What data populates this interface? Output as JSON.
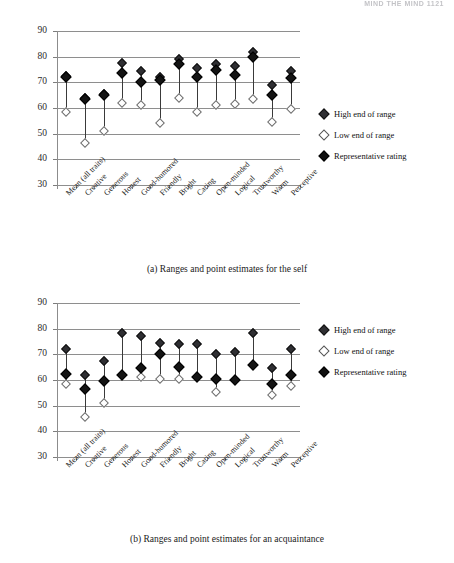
{
  "header": {
    "running_head": "MIND THE MIND 1121"
  },
  "legend": {
    "items": [
      {
        "label": "High end of range",
        "marker": "filled-diamond",
        "color": "#2f2f33"
      },
      {
        "label": "Low end of range",
        "marker": "hollow-diamond",
        "color": "#ffffff"
      },
      {
        "label": "Representative rating",
        "marker": "filled-diamond",
        "color": "#101010"
      }
    ]
  },
  "figures": [
    {
      "id": "a",
      "caption": "(a) Ranges and point estimates for the self"
    },
    {
      "id": "b",
      "caption": "(b) Ranges and point estimates for an acquaintance"
    }
  ],
  "chart_data": [
    {
      "type": "scatter",
      "title": "(a) Ranges and point estimates for the self",
      "xlabel": "",
      "ylabel": "",
      "ylim": [
        30,
        90
      ],
      "yticks": [
        30,
        40,
        50,
        60,
        70,
        80,
        90
      ],
      "grid": true,
      "legend_position": "right",
      "categories": [
        "Mean (all traits)",
        "Creative",
        "Generous",
        "Honest",
        "Good-humored",
        "Friendly",
        "Bright",
        "Caring",
        "Open-minded",
        "Logical",
        "Trustworthy",
        "Warm",
        "Perceptive"
      ],
      "series": [
        {
          "name": "High end of range",
          "values": [
            72.5,
            64.0,
            65.5,
            77.5,
            74.5,
            72.0,
            79.0,
            75.5,
            77.0,
            76.5,
            82.0,
            69.0,
            74.5
          ]
        },
        {
          "name": "Low end of range",
          "values": [
            58.5,
            46.5,
            51.0,
            62.0,
            61.0,
            54.0,
            64.0,
            58.5,
            61.0,
            61.5,
            63.5,
            54.5,
            59.5
          ]
        },
        {
          "name": "Representative rating",
          "values": [
            72.0,
            63.5,
            65.0,
            73.5,
            70.0,
            71.0,
            77.0,
            72.0,
            75.0,
            73.0,
            80.0,
            65.0,
            71.5
          ]
        }
      ]
    },
    {
      "type": "scatter",
      "title": "(b) Ranges and point estimates for an acquaintance",
      "xlabel": "",
      "ylabel": "",
      "ylim": [
        30,
        90
      ],
      "yticks": [
        30,
        40,
        50,
        60,
        70,
        80,
        90
      ],
      "grid": true,
      "legend_position": "right",
      "categories": [
        "Mean (all traits)",
        "Creative",
        "Generous",
        "Honest",
        "Good-humored",
        "Friendly",
        "Bright",
        "Caring",
        "Open-minded",
        "Logical",
        "Trustworthy",
        "Warm",
        "Perceptive"
      ],
      "series": [
        {
          "name": "High end of range",
          "values": [
            72.0,
            62.0,
            67.5,
            78.5,
            77.0,
            74.5,
            74.0,
            74.0,
            70.0,
            71.0,
            78.5,
            64.5,
            72.0
          ]
        },
        {
          "name": "Low end of range",
          "values": [
            58.5,
            45.5,
            51.0,
            62.0,
            61.0,
            60.5,
            60.5,
            61.0,
            55.5,
            60.0,
            66.0,
            54.0,
            57.5
          ]
        },
        {
          "name": "Representative rating",
          "values": [
            62.5,
            56.5,
            59.5,
            62.0,
            64.5,
            70.0,
            65.0,
            61.0,
            60.5,
            60.0,
            66.0,
            58.5,
            62.0
          ]
        }
      ]
    }
  ]
}
